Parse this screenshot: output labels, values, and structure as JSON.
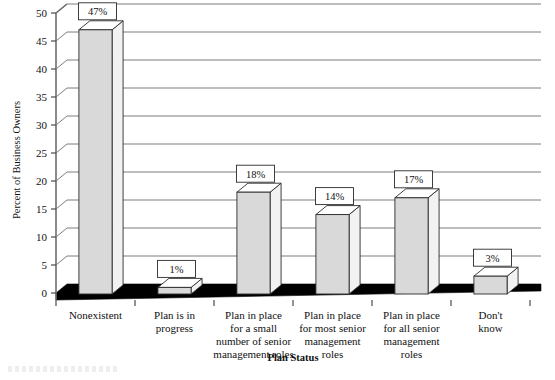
{
  "chart_data": {
    "type": "bar",
    "title": "",
    "subtitle": "",
    "xlabel": "Plan Status",
    "ylabel": "Percent of Business Owners",
    "ylim": [
      0,
      50
    ],
    "ytick_step": 5,
    "yticks": [
      "0",
      "5",
      "10",
      "15",
      "20",
      "25",
      "30",
      "35",
      "40",
      "45",
      "50"
    ],
    "grid": true,
    "legend": "none",
    "style": "3d-column",
    "categories": [
      "Nonexistent",
      "Plan is in progress",
      "Plan in place for a small number of senior management roles",
      "Plan in place for most senior management roles",
      "Plan in place for all senior management roles",
      "Don't know"
    ],
    "category_label_lines": [
      [
        "Nonexistent"
      ],
      [
        "Plan is in",
        "progress"
      ],
      [
        "Plan in place",
        "for a small",
        "number of senior",
        "management roles"
      ],
      [
        "Plan in place",
        "for most senior",
        "management",
        "roles"
      ],
      [
        "Plan in place",
        "for all senior",
        "management",
        "roles"
      ],
      [
        "Don't",
        "know"
      ]
    ],
    "values": [
      47,
      1,
      18,
      14,
      17,
      3
    ],
    "data_labels": [
      "47%",
      "1%",
      "18%",
      "14%",
      "17%",
      "3%"
    ],
    "colors": {
      "bar_front": "#d9d9d9",
      "bar_side": "#f2f2f2",
      "bar_top": "#ffffff",
      "outline": "#2b2b2b",
      "gridline": "#7d7d7d",
      "floor": "#000000",
      "text": "#111111",
      "background": "#ffffff"
    }
  }
}
